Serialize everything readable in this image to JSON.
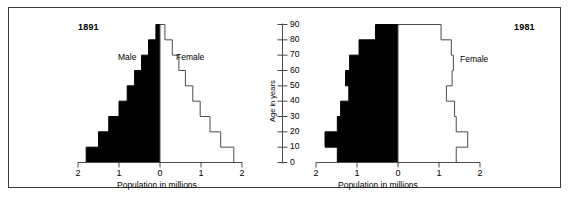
{
  "figure": {
    "background": "#ffffff",
    "border_color": "#3a3a3a"
  },
  "shared": {
    "xlabel": "Population in millions",
    "ylabel": "Age in years",
    "x_tick_labels": [
      "2",
      "1",
      "0",
      "1",
      "2"
    ],
    "age_tick_labels": [
      "0",
      "10",
      "20",
      "30",
      "40",
      "50",
      "60",
      "70",
      "80",
      "90"
    ],
    "male_label": "Male",
    "female_label": "Female",
    "male_color": "#000000",
    "female_color": "#ffffff",
    "outline_color": "#4a4a4a"
  },
  "chart_data": [
    {
      "type": "bar",
      "orientation": "population-pyramid",
      "title": "1891",
      "xlabel": "Population in millions",
      "ylabel": "Age in years",
      "xlim": [
        -2,
        2
      ],
      "ylim": [
        0,
        90
      ],
      "xticks": [
        -2,
        -1,
        0,
        1,
        2
      ],
      "xtick_labels": [
        "2",
        "1",
        "0",
        "1",
        "2"
      ],
      "yticks": [
        0,
        10,
        20,
        30,
        40,
        50,
        60,
        70,
        80,
        90
      ],
      "grid": false,
      "legend": [
        "Male",
        "Female"
      ],
      "legend_position": "inside-upper",
      "age_groups": [
        "0-9",
        "10-19",
        "20-29",
        "30-39",
        "40-49",
        "50-59",
        "60-69",
        "70-79",
        "80-89"
      ],
      "series": [
        {
          "name": "Male",
          "side": "left",
          "values": [
            1.8,
            1.5,
            1.25,
            1.0,
            0.8,
            0.62,
            0.45,
            0.28,
            0.1
          ]
        },
        {
          "name": "Female",
          "side": "right",
          "values": [
            1.8,
            1.48,
            1.22,
            0.98,
            0.8,
            0.62,
            0.46,
            0.3,
            0.12
          ]
        }
      ]
    },
    {
      "type": "bar",
      "orientation": "population-pyramid",
      "title": "1981",
      "xlabel": "Population in millions",
      "ylabel": "Age in years",
      "xlim": [
        -2,
        2
      ],
      "ylim": [
        0,
        90
      ],
      "xticks": [
        -2,
        -1,
        0,
        1,
        2
      ],
      "xtick_labels": [
        "2",
        "1",
        "0",
        "1",
        "2"
      ],
      "yticks": [
        0,
        10,
        20,
        30,
        40,
        50,
        60,
        70,
        80,
        90
      ],
      "grid": false,
      "legend": [
        "Male",
        "Female"
      ],
      "legend_position": "inside-upper",
      "age_groups": [
        "0-9",
        "10-19",
        "20-29",
        "30-39",
        "40-49",
        "50-59",
        "60-69",
        "70-79",
        "80-89"
      ],
      "series": [
        {
          "name": "Male",
          "side": "left",
          "values": [
            1.48,
            1.78,
            1.48,
            1.4,
            1.2,
            1.28,
            1.18,
            0.95,
            0.55
          ]
        },
        {
          "name": "Female",
          "side": "right",
          "values": [
            1.42,
            1.7,
            1.42,
            1.38,
            1.18,
            1.32,
            1.35,
            1.3,
            1.05
          ]
        }
      ]
    }
  ],
  "panels": {
    "left": {
      "year": "1891",
      "male_label": "Male",
      "female_label": "Female",
      "xlabel": "Population in millions"
    },
    "right": {
      "year": "1981",
      "male_label": "Male",
      "female_label": "Female",
      "xlabel": "Population in millions"
    }
  },
  "center_axis": {
    "ylabel": "Age in years",
    "ticks": [
      "90",
      "80",
      "70",
      "60",
      "50",
      "40",
      "30",
      "20",
      "10",
      "0"
    ]
  }
}
